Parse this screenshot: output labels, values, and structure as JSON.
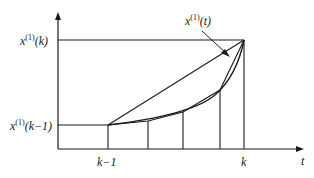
{
  "diagram": {
    "labels": {
      "y_top": {
        "base": "x",
        "sup": "(1)",
        "arg": "(k)"
      },
      "y_bottom": {
        "base": "x",
        "sup": "(1)",
        "arg": "(k−1)"
      },
      "curve": {
        "base": "x",
        "sup": "(1)",
        "arg": "(t)"
      },
      "x_k_minus_1": "k−1",
      "x_k": "k",
      "x_axis": "t"
    },
    "colors": {
      "line": "#1a1a1a",
      "background": "#ffffff"
    },
    "geometry": {
      "origin": [
        58,
        149
      ],
      "y_axis_top": 12,
      "x_axis_right": 304,
      "y_top_level": 40,
      "y_bottom_level": 125,
      "x_k_minus_1": 108,
      "x_k": 244,
      "subdivisions": [
        148,
        183,
        220
      ],
      "curve_points": [
        [
          108,
          125
        ],
        [
          148,
          121
        ],
        [
          183,
          112
        ],
        [
          220,
          90
        ],
        [
          244,
          40
        ]
      ]
    }
  }
}
